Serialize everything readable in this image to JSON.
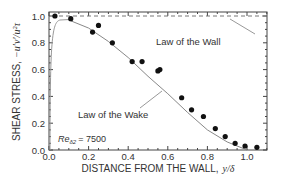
{
  "chart_data": {
    "type": "scatter",
    "title": "",
    "xlabel": "DISTANCE FROM THE WALL,",
    "xlabel_symbol": "y/δ",
    "ylabel": "SHEAR STRESS,",
    "ylabel_symbol": "−u′v′/u²τ",
    "xlim": [
      0.0,
      1.1
    ],
    "ylim": [
      0.0,
      1.05
    ],
    "xticks": [
      "0.0",
      "0.2",
      "0.4",
      "0.6",
      "0.8",
      "1.0"
    ],
    "yticks": [
      "0.0",
      "0.2",
      "0.4",
      "0.6",
      "0.8",
      "1.0"
    ],
    "grid": false,
    "annotations": {
      "law_of_wall": "Law of the Wall",
      "law_of_wake": "Law of the Wake",
      "reynolds_label": "Re",
      "reynolds_sub": "δ2",
      "reynolds_value": "= 7500"
    },
    "series": [
      {
        "name": "Measured data",
        "kind": "points",
        "x": [
          0.03,
          0.11,
          0.22,
          0.25,
          0.32,
          0.42,
          0.47,
          0.55,
          0.56,
          0.67,
          0.72,
          0.78,
          0.84,
          0.89,
          0.94,
          0.99,
          1.05
        ],
        "y": [
          1.0,
          0.98,
          0.88,
          0.93,
          0.8,
          0.66,
          0.66,
          0.59,
          0.6,
          0.39,
          0.3,
          0.25,
          0.16,
          0.1,
          0.05,
          0.03,
          0.02
        ]
      },
      {
        "name": "Law of the Wall",
        "kind": "dashed-line",
        "x": [
          0.0,
          1.1
        ],
        "y": [
          1.0,
          1.0
        ]
      },
      {
        "name": "Law of the Wake",
        "kind": "solid-line",
        "x": [
          0.0,
          0.02,
          0.05,
          0.1,
          0.2,
          0.3,
          0.4,
          0.5,
          0.6,
          0.7,
          0.8,
          0.9,
          1.0
        ],
        "y": [
          0.0,
          0.85,
          0.96,
          0.97,
          0.91,
          0.81,
          0.69,
          0.55,
          0.42,
          0.28,
          0.15,
          0.06,
          0.0
        ]
      }
    ]
  }
}
